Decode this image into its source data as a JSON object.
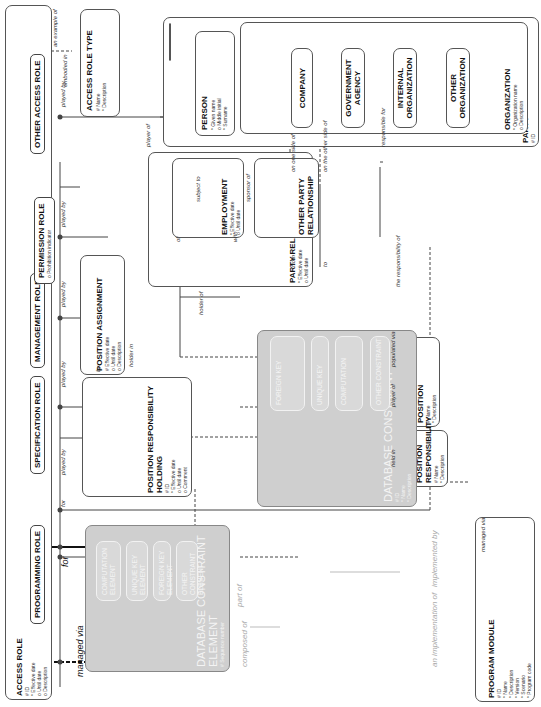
{
  "diagram": {
    "access_role": {
      "title": "ACCESS ROLE",
      "attrs": [
        "# ID",
        "* Effective date",
        "o Until date",
        "o Description"
      ]
    },
    "roles": [
      {
        "title": "PROGRAMMING ROLE",
        "attrs": []
      },
      {
        "title": "SPECIFICATION ROLE",
        "attrs": []
      },
      {
        "title": "MANAGEMENT ROLE",
        "attrs": []
      },
      {
        "title": "PERMISSION ROLE",
        "attrs": [
          "o Prohibition indicator"
        ]
      },
      {
        "title": "OTHER ACCESS ROLE",
        "attrs": []
      }
    ],
    "access_role_type": {
      "title": "ACCESS ROLE TYPE",
      "attrs": [
        "# Name",
        "* Description"
      ]
    },
    "party": {
      "title": "PARTY",
      "attrs": [
        "# ID"
      ]
    },
    "person": {
      "title": "PERSON",
      "attrs": [
        "* Given name",
        "o Middle initial",
        "* Surname"
      ]
    },
    "organization": {
      "title": "ORGANIZATION",
      "attrs": [
        "* Organization name",
        "o Description"
      ]
    },
    "org_subtypes": [
      "COMPANY",
      "GOVERNMENT AGENCY",
      "INTERNAL ORGANIZATION",
      "OTHER ORGANIZATION"
    ],
    "party_relationship": {
      "title": "PARTY RELATIONSHIP",
      "attrs": [
        "* Effective date",
        "o Until date"
      ]
    },
    "employment": {
      "title": "EMPLOYMENT",
      "attrs": [
        "* Effective date",
        "o Until date"
      ]
    },
    "other_party_relationship": {
      "title": "OTHER PARTY RELATIONSHIP"
    },
    "position_assignment": {
      "title": "POSITION ASSIGNMENT",
      "attrs": [
        "# Effective date",
        "o Until date",
        "o Description"
      ]
    },
    "position_responsibility_holding": {
      "title": "POSITION RESPONSIBILITY HOLDING",
      "attrs": [
        "# ID",
        "* Effective date",
        "o Until date",
        "o Comment"
      ]
    },
    "position": {
      "title": "POSITION",
      "attrs": [
        "# Name",
        "* Description"
      ]
    },
    "position_responsibility": {
      "title": "POSITION RESPONSIBILITY",
      "attrs": [
        "# Name",
        "* Description"
      ]
    },
    "db_constraint_element": {
      "title": "DATABASE CONSTRAINT ELEMENT",
      "attrs": [
        "# Sequence number"
      ],
      "subtypes": [
        {
          "title": "COMPUTATION ELEMENT",
          "attrs": [
            "* Operator",
            "o Constant"
          ]
        },
        {
          "title": "UNIQUE KEY ELEMENT",
          "attrs": [
            "# Sequence number"
          ]
        },
        {
          "title": "FOREIGN KEY ELEMENT",
          "attrs": []
        },
        {
          "title": "OTHER CONSTRAINT ELEMENT",
          "attrs": []
        }
      ]
    },
    "db_constraint": {
      "title": "DATABASE CONSTRAINT",
      "attrs": [
        "# ID",
        "* Name",
        "* Description"
      ],
      "subtypes": [
        {
          "title": "FOREIGN KEY",
          "attrs": [
            "# ID",
            "* Name",
            "* Referential integrity constraint"
          ]
        },
        {
          "title": "UNIQUE KEY",
          "attrs": []
        },
        {
          "title": "COMPUTATION",
          "attrs": [
            "# Sequence number",
            "* Formula"
          ]
        },
        {
          "title": "OTHER CONSTRAINT",
          "attrs": []
        }
      ]
    },
    "program_module": {
      "title": "PROGRAM MODULE",
      "attrs": [
        "# ID",
        "* Name",
        "* Description",
        "* Version",
        "* Scenario",
        "* Program code"
      ]
    },
    "labels": {
      "managed_via": "managed via",
      "for": "for",
      "played_by": "played by",
      "player_of": "player of",
      "an_example_of": "an example of",
      "embodied_in": "embodied in",
      "subject_to": "subject to",
      "sponsor_of": "sponsor of",
      "of": "of",
      "with": "with",
      "from": "from",
      "to": "to",
      "on_one_side_of": "on one side of",
      "on_the_other_side_of": "on the other side of",
      "holder_of": "holder of",
      "holder_in": "holder in",
      "by": "by",
      "held_in": "held in",
      "populated_via": "populated via",
      "the_responsibility_of": "the responsibility of",
      "responsible_for": "responsible for",
      "part_of": "part of",
      "composed_of": "composed of",
      "implemented_by": "implemented by",
      "an_implementation_of": "an implementation of"
    }
  }
}
